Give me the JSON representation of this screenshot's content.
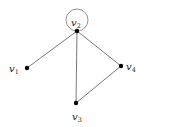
{
  "diagram": {
    "type": "graph",
    "nodes": [
      {
        "id": "v1",
        "label": "v",
        "sub": "1",
        "x": 27,
        "y": 68,
        "lx": 9,
        "ly": 72
      },
      {
        "id": "v2",
        "label": "v",
        "sub": "2",
        "x": 77,
        "y": 31,
        "lx": 71,
        "ly": 26
      },
      {
        "id": "v3",
        "label": "v",
        "sub": "3",
        "x": 76,
        "y": 103,
        "lx": 72,
        "ly": 120
      },
      {
        "id": "v4",
        "label": "v",
        "sub": "4",
        "x": 121,
        "y": 66,
        "lx": 126,
        "ly": 70
      }
    ],
    "edges": [
      {
        "from": "v1",
        "to": "v2"
      },
      {
        "from": "v2",
        "to": "v3"
      },
      {
        "from": "v2",
        "to": "v4"
      },
      {
        "from": "v3",
        "to": "v4"
      }
    ],
    "loops": [
      {
        "node": "v2",
        "cx": 77,
        "cy": 20,
        "r": 11
      }
    ]
  }
}
